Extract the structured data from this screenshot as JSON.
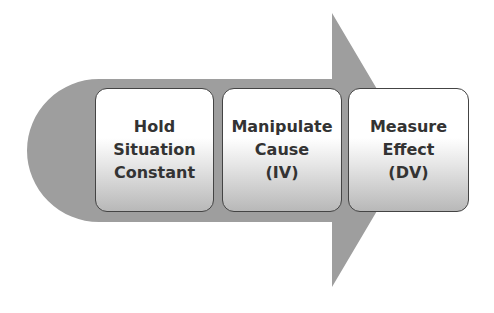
{
  "diagram": {
    "type": "process-arrow",
    "colors": {
      "arrow_fill": "#9e9e9e",
      "box_border": "#444444",
      "box_top": "#ffffff",
      "box_bottom": "#b8b8b8",
      "text": "#333333"
    },
    "steps": [
      {
        "lines": [
          "Hold",
          "Situation",
          "Constant"
        ]
      },
      {
        "lines": [
          "Manipulate",
          "Cause",
          "(IV)"
        ]
      },
      {
        "lines": [
          "Measure",
          "Effect",
          "(DV)"
        ]
      }
    ]
  }
}
